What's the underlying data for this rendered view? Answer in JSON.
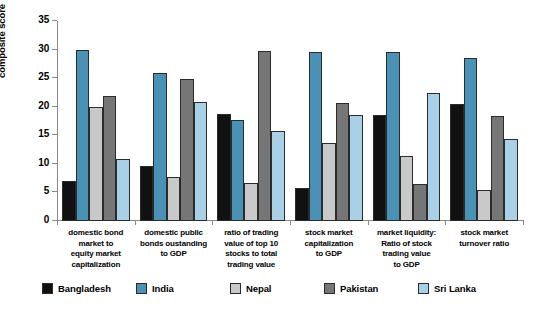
{
  "chart_data": {
    "type": "bar",
    "title": "",
    "xlabel": "",
    "ylabel": "composite score",
    "ylim": [
      0,
      35
    ],
    "yticks": [
      0,
      5,
      10,
      15,
      20,
      25,
      30,
      35
    ],
    "grid": false,
    "legend_position": "bottom",
    "categories": [
      "domestic bond market to equity market capitalization",
      "domestic public bonds oustanding to GDP",
      "ratio of trading value of top 10 stocks to total trading value",
      "stock market capitalization to GDP",
      "market liquidity: Ratio of stock trading value to GDP",
      "stock market turnover ratio"
    ],
    "category_lines": [
      [
        "domestic bond",
        "market to",
        "equity market",
        "capitalization"
      ],
      [
        "domestic public",
        "bonds oustanding",
        "to GDP"
      ],
      [
        "ratio of trading",
        "value of top 10",
        "stocks to total",
        "trading value"
      ],
      [
        "stock market",
        "capitalization",
        "to GDP"
      ],
      [
        "market liquidity:",
        "Ratio of stock",
        "trading value",
        "to GDP"
      ],
      [
        "stock market",
        "turnover ratio"
      ]
    ],
    "series": [
      {
        "name": "Bangladesh",
        "color": "#111111",
        "values": [
          7.0,
          9.7,
          18.7,
          5.7,
          18.5,
          20.4
        ]
      },
      {
        "name": "India",
        "color": "#4a92b5",
        "values": [
          29.9,
          25.9,
          17.7,
          29.6,
          29.5,
          28.5
        ]
      },
      {
        "name": "Nepal",
        "color": "#c9c9c9",
        "values": [
          19.9,
          7.7,
          6.7,
          13.6,
          11.3,
          5.4
        ]
      },
      {
        "name": "Pakistan",
        "color": "#767676",
        "values": [
          21.9,
          24.9,
          29.7,
          20.6,
          6.4,
          18.3
        ]
      },
      {
        "name": "Sri Lanka",
        "color": "#a8d0e6",
        "values": [
          10.9,
          20.8,
          15.7,
          18.5,
          22.4,
          14.4
        ]
      }
    ]
  },
  "axis": {
    "y_title": "composite score",
    "tick_labels": [
      "0",
      "5",
      "10",
      "15",
      "20",
      "25",
      "30",
      "35"
    ]
  },
  "legend": {
    "items": [
      {
        "label": "Bangladesh",
        "color": "#111111"
      },
      {
        "label": "India",
        "color": "#4a92b5"
      },
      {
        "label": "Nepal",
        "color": "#c9c9c9"
      },
      {
        "label": "Pakistan",
        "color": "#767676"
      },
      {
        "label": "Sri Lanka",
        "color": "#a8d0e6"
      }
    ]
  }
}
